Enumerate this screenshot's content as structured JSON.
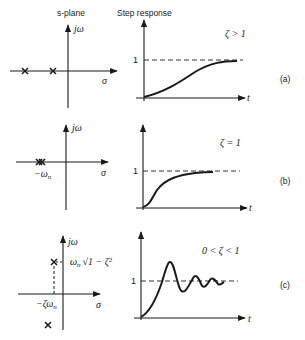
{
  "headers": {
    "s_plane": "s-plane",
    "step_response": "Step response"
  },
  "axes": {
    "imag_label": "jω",
    "real_label": "σ",
    "time_label": "t",
    "steady_state_label": "1"
  },
  "panels": [
    {
      "id": "a",
      "panel_label": "(a)",
      "condition": "ζ > 1",
      "pole_description": "two distinct real poles",
      "pole_labels": [],
      "response_type": "overdamped"
    },
    {
      "id": "b",
      "panel_label": "(b)",
      "condition": "ζ = 1",
      "pole_description": "double real pole",
      "pole_labels": [
        "−ωn"
      ],
      "response_type": "critically damped"
    },
    {
      "id": "c",
      "panel_label": "(c)",
      "condition": "0 < ζ < 1",
      "pole_description": "complex conjugate poles",
      "pole_labels": [
        "−ζωn",
        "ωn√(1 − ζ²)"
      ],
      "response_type": "underdamped"
    }
  ],
  "labels": {
    "a_cond": "ζ > 1",
    "b_cond": "ζ = 1",
    "c_cond": "0 < ζ < 1",
    "b_pole": "−ω",
    "b_pole_sub": "n",
    "c_real": "−ζω",
    "c_real_sub": "n",
    "c_imag_w": "ω",
    "c_imag_sub": "n",
    "c_imag_rest": "√1 − ζ²",
    "a_panel": "(a)",
    "b_panel": "(b)",
    "c_panel": "(c)"
  }
}
